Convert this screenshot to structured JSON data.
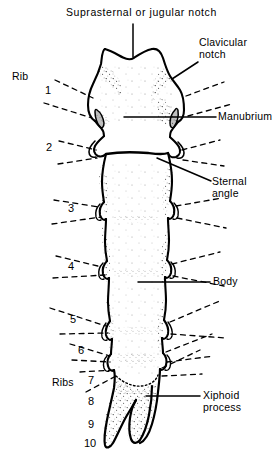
{
  "figure": {
    "kind": "anatomical-line-drawing",
    "width": 279,
    "height": 467,
    "background_color": "#ffffff",
    "ink_color": "#000000"
  },
  "labels": {
    "title": "Suprasternal or jugular notch",
    "clavicular_notch_line1": "Clavicular",
    "clavicular_notch_line2": "notch",
    "rib": "Rib",
    "manubrium": "Manubrium",
    "sternal_angle_line1": "Sternal",
    "sternal_angle_line2": "angle",
    "body": "Body",
    "ribs": "Ribs",
    "xiphoid_line1": "Xiphoid",
    "xiphoid_line2": "process"
  },
  "rib_numbers": {
    "left_column": [
      "1",
      "2",
      "3",
      "4",
      "5",
      "6"
    ],
    "lower_column": [
      "7",
      "8",
      "9",
      "10"
    ]
  },
  "annotations": {
    "leader_style_solid": "solid",
    "leader_style_rib": "dashed"
  }
}
